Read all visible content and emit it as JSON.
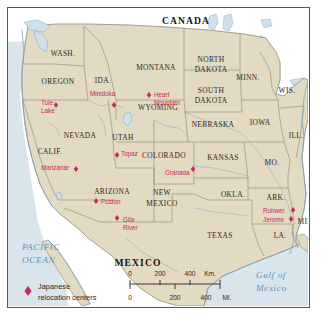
{
  "map": {
    "title_country_north": "CANADA",
    "title_country_south": "MEXICO",
    "ocean_west_line1": "PACIFIC",
    "ocean_west_line2": "OCEAN",
    "ocean_east_line1": "Gulf of",
    "ocean_east_line2": "Mexico",
    "colors": {
      "land": "#e3dac3",
      "water": "#d6e3ea",
      "marker": "#c7295c",
      "state_border": "#8d8878",
      "coastline": "#7fa8c4",
      "frame": "#55585c",
      "label_dark": "#2a2722",
      "ocean_label": "#5d93b8"
    }
  },
  "states": [
    {
      "name": "WASH.",
      "x": 55,
      "y": 46
    },
    {
      "name": "OREGON",
      "x": 50,
      "y": 74
    },
    {
      "name": "IDA.",
      "x": 95,
      "y": 73
    },
    {
      "name": "MONTANA",
      "x": 148,
      "y": 60
    },
    {
      "name": "NORTH",
      "x": 203,
      "y": 52
    },
    {
      "name": "DAKOTA",
      "x": 203,
      "y": 62
    },
    {
      "name": "SOUTH",
      "x": 203,
      "y": 83
    },
    {
      "name": "DAKOTA",
      "x": 203,
      "y": 93
    },
    {
      "name": "MINN.",
      "x": 240,
      "y": 70
    },
    {
      "name": "WIS.",
      "x": 279,
      "y": 83
    },
    {
      "name": "WYOMING",
      "x": 150,
      "y": 100
    },
    {
      "name": "NEBRASKA",
      "x": 205,
      "y": 117
    },
    {
      "name": "IOWA",
      "x": 252,
      "y": 115
    },
    {
      "name": "ILL.",
      "x": 288,
      "y": 128
    },
    {
      "name": "NEVADA",
      "x": 72,
      "y": 128
    },
    {
      "name": "UTAH",
      "x": 115,
      "y": 130
    },
    {
      "name": "CALIF.",
      "x": 42,
      "y": 144
    },
    {
      "name": "COLORADO",
      "x": 156,
      "y": 148
    },
    {
      "name": "KANSAS",
      "x": 215,
      "y": 150
    },
    {
      "name": "MO.",
      "x": 264,
      "y": 155
    },
    {
      "name": "ARIZONA",
      "x": 104,
      "y": 184
    },
    {
      "name": "NEW",
      "x": 154,
      "y": 185
    },
    {
      "name": "MEXICO",
      "x": 154,
      "y": 196
    },
    {
      "name": "OKLA.",
      "x": 225,
      "y": 187
    },
    {
      "name": "ARK.",
      "x": 268,
      "y": 190
    },
    {
      "name": "MISS.",
      "x": 300,
      "y": 214
    },
    {
      "name": "TEXAS",
      "x": 212,
      "y": 228
    },
    {
      "name": "LA.",
      "x": 272,
      "y": 228
    }
  ],
  "relocation_centers": [
    {
      "name": "Tule\nLake",
      "lines": [
        "Tule",
        "Lake"
      ],
      "label_x": 33,
      "label_y": 95,
      "align": "start",
      "marker_x": 48,
      "marker_y": 97
    },
    {
      "name": "Minidoka",
      "lines": [
        "Minidoka"
      ],
      "label_x": 82,
      "label_y": 86,
      "align": "start",
      "marker_x": 106,
      "marker_y": 97
    },
    {
      "name": "Heart Mountain",
      "lines": [
        "Heart",
        "Mountain"
      ],
      "label_x": 146,
      "label_y": 87,
      "align": "start",
      "marker_x": 141,
      "marker_y": 87
    },
    {
      "name": "Manzanar",
      "lines": [
        "Manzanar"
      ],
      "label_x": 33,
      "label_y": 160,
      "align": "start",
      "marker_x": 68,
      "marker_y": 161
    },
    {
      "name": "Topaz",
      "lines": [
        "Topaz"
      ],
      "label_x": 113,
      "label_y": 146,
      "align": "start",
      "marker_x": 109,
      "marker_y": 147
    },
    {
      "name": "Granada",
      "lines": [
        "Granada"
      ],
      "label_x": 157,
      "label_y": 165,
      "align": "start",
      "marker_x": 185,
      "marker_y": 161
    },
    {
      "name": "Poston",
      "lines": [
        "Poston"
      ],
      "label_x": 93,
      "label_y": 194,
      "align": "start",
      "marker_x": 88,
      "marker_y": 193
    },
    {
      "name": "Gila River",
      "lines": [
        "Gila",
        "River"
      ],
      "label_x": 115,
      "label_y": 212,
      "align": "start",
      "marker_x": 109,
      "marker_y": 210
    },
    {
      "name": "Rohwer",
      "lines": [
        "Rohwer"
      ],
      "label_x": 255,
      "label_y": 203,
      "align": "start",
      "marker_x": 285,
      "marker_y": 202
    },
    {
      "name": "Jerome",
      "lines": [
        "Jerome"
      ],
      "label_x": 255,
      "label_y": 212,
      "align": "start",
      "marker_x": 283,
      "marker_y": 211
    }
  ],
  "legend": {
    "label_line1": "Japanese",
    "label_line2": "relocation centers",
    "marker_icon": "diamond-marker-icon"
  },
  "scale_bar": {
    "km_unit": "Km.",
    "mi_unit": "Mi.",
    "km_ticks": [
      "0",
      "200",
      "400"
    ],
    "mi_ticks": [
      "0",
      "200",
      "400"
    ]
  }
}
